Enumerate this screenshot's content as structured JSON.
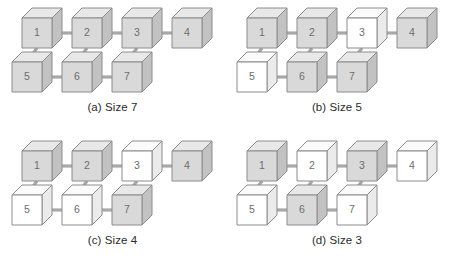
{
  "figure": {
    "colors": {
      "filled_front": "#d9d9d9",
      "filled_top": "#e8e8e8",
      "filled_side": "#c2c2c2",
      "empty_front": "#ffffff",
      "empty_top": "#fbfbfb",
      "empty_side": "#ebebeb",
      "stroke": "#8c8c8c",
      "link": "#a8a8a8",
      "label": "#6d6d6d",
      "caption": "#2b2b2b",
      "background": "#ffffff"
    },
    "node_labels": [
      "1",
      "2",
      "3",
      "4",
      "5",
      "6",
      "7"
    ],
    "edges": [
      [
        "1",
        "2"
      ],
      [
        "2",
        "3"
      ],
      [
        "3",
        "4"
      ],
      [
        "5",
        "6"
      ],
      [
        "6",
        "7"
      ],
      [
        "1",
        "5"
      ],
      [
        "2",
        "6"
      ],
      [
        "3",
        "7"
      ]
    ],
    "panels": [
      {
        "id": "a",
        "caption": "(a) Size 7",
        "size": 7,
        "nodes": [
          {
            "label": "1",
            "filled": true
          },
          {
            "label": "2",
            "filled": true
          },
          {
            "label": "3",
            "filled": true
          },
          {
            "label": "4",
            "filled": true
          },
          {
            "label": "5",
            "filled": true
          },
          {
            "label": "6",
            "filled": true
          },
          {
            "label": "7",
            "filled": true
          }
        ]
      },
      {
        "id": "b",
        "caption": "(b) Size 5",
        "size": 5,
        "nodes": [
          {
            "label": "1",
            "filled": true
          },
          {
            "label": "2",
            "filled": true
          },
          {
            "label": "3",
            "filled": false
          },
          {
            "label": "4",
            "filled": true
          },
          {
            "label": "5",
            "filled": false
          },
          {
            "label": "6",
            "filled": true
          },
          {
            "label": "7",
            "filled": true
          }
        ]
      },
      {
        "id": "c",
        "caption": "(c) Size 4",
        "size": 4,
        "nodes": [
          {
            "label": "1",
            "filled": true
          },
          {
            "label": "2",
            "filled": true
          },
          {
            "label": "3",
            "filled": false
          },
          {
            "label": "4",
            "filled": true
          },
          {
            "label": "5",
            "filled": false
          },
          {
            "label": "6",
            "filled": false
          },
          {
            "label": "7",
            "filled": true
          }
        ]
      },
      {
        "id": "d",
        "caption": "(d) Size 3",
        "size": 3,
        "nodes": [
          {
            "label": "1",
            "filled": true
          },
          {
            "label": "2",
            "filled": false
          },
          {
            "label": "3",
            "filled": true
          },
          {
            "label": "4",
            "filled": false
          },
          {
            "label": "5",
            "filled": false
          },
          {
            "label": "6",
            "filled": true
          },
          {
            "label": "7",
            "filled": false
          }
        ]
      }
    ]
  }
}
